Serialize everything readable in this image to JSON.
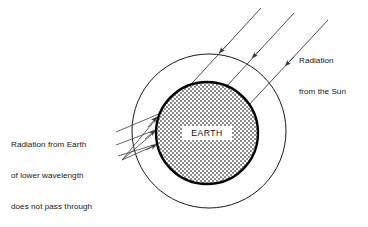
{
  "diagram": {
    "earth_label": "EARTH",
    "labels": {
      "sun_radiation": {
        "line1": "Radiation",
        "line2": "from the Sun"
      },
      "earth_radiation": {
        "line1": "Radiation from Earth",
        "line2": "of lower wavelength",
        "line3": "does not pass through",
        "line4_pre": "CO",
        "line4_sub": "2",
        "line4_post": " layer"
      }
    },
    "colors": {
      "background": "#fefefe",
      "line": "#3a3a3a",
      "outer_circle_stroke": "#1a1a1a",
      "earth_stroke": "#000000",
      "earth_fill": "#9b9b9b",
      "text": "#171717",
      "label_box": "#ffffff"
    },
    "geometry": {
      "outer_circle": {
        "cx": 209,
        "cy": 131,
        "r": 77,
        "stroke_width": 1.0
      },
      "earth_circle": {
        "cx": 207,
        "cy": 133,
        "r": 51,
        "stroke_width": 2.4
      }
    },
    "sun_rays": {
      "count": 3,
      "direction": "upper-right to lower-left",
      "arrowhead_position": "mid-ray",
      "rays": [
        {
          "x1": 261,
          "y1": 8,
          "x2": 183,
          "y2": 93,
          "ax": 222,
          "ay": 50
        },
        {
          "x1": 294,
          "y1": 13,
          "x2": 215,
          "y2": 99,
          "ax": 255,
          "ay": 55
        },
        {
          "x1": 328,
          "y1": 20,
          "x2": 247,
          "y2": 107,
          "ax": 288,
          "ay": 63
        }
      ]
    },
    "earth_rays": {
      "count": 3,
      "description": "Rays leaving Earth surface toward the CO2 layer and reflecting back",
      "origin": {
        "x": 122,
        "y": 160
      },
      "outgoing": [
        {
          "x1": 122,
          "y1": 160,
          "x2": 159,
          "y2": 114,
          "ax": 149,
          "ay": 126
        },
        {
          "x1": 122,
          "y1": 160,
          "x2": 156,
          "y2": 130,
          "ax": 147,
          "ay": 137
        },
        {
          "x1": 122,
          "y1": 160,
          "x2": 158,
          "y2": 144,
          "ax": 148,
          "ay": 148
        }
      ],
      "reflected": [
        {
          "x1": 159,
          "y1": 114,
          "x2": 117,
          "y2": 133
        },
        {
          "x1": 156,
          "y1": 130,
          "x2": 117,
          "y2": 146
        },
        {
          "x1": 158,
          "y1": 144,
          "x2": 119,
          "y2": 157
        }
      ]
    }
  }
}
